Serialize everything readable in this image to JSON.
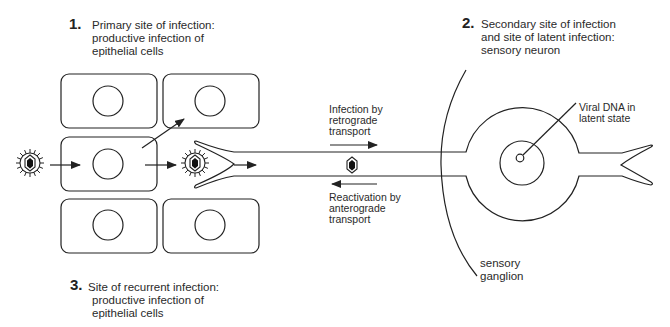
{
  "labels": {
    "site1": {
      "number": "1.",
      "lines": [
        "Primary site of infection:",
        "productive infection of",
        "epithelial cells"
      ]
    },
    "site2": {
      "number": "2.",
      "lines": [
        "Secondary site of infection",
        "and site of latent infection:",
        "sensory neuron"
      ]
    },
    "site3": {
      "number": "3.",
      "lines": [
        "Site of recurrent infection:",
        "productive infection of",
        "epithelial cells"
      ]
    },
    "retrograde": [
      "Infection by",
      "retrograde",
      "transport"
    ],
    "anterograde": [
      "Reactivation by",
      "anterograde",
      "transport"
    ],
    "viral_dna": [
      "Viral DNA in",
      "latent state"
    ],
    "ganglion": [
      "sensory",
      "ganglion"
    ]
  },
  "icons": {
    "virion": "enveloped-virus-icon",
    "capsid": "viral-capsid-icon"
  }
}
